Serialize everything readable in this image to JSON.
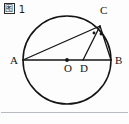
{
  "figure": {
    "caption_cjk": "图",
    "caption_number": "1",
    "caption_full": "图 1",
    "background_color": "#fdfdfd",
    "stroke_color": "#141414",
    "separator_color": "#b8bcc2"
  },
  "diagram": {
    "type": "circle-geometry",
    "circle": {
      "name": "main-circle",
      "center_x": 67,
      "center_y": 60,
      "radius": 44
    },
    "points": [
      {
        "id": "A",
        "label": "A",
        "x": 23,
        "y": 60,
        "label_x": 10,
        "label_y": 64,
        "dot": false
      },
      {
        "id": "B",
        "label": "B",
        "x": 111,
        "y": 60,
        "label_x": 115,
        "label_y": 64,
        "dot": false
      },
      {
        "id": "C",
        "label": "C",
        "x": 100,
        "y": 26,
        "label_x": 100,
        "label_y": 14,
        "dot": false
      },
      {
        "id": "O",
        "label": "O",
        "x": 67,
        "y": 60,
        "label_x": 64,
        "label_y": 72,
        "dot": true
      },
      {
        "id": "D",
        "label": "D",
        "x": 83,
        "y": 60,
        "label_x": 80,
        "label_y": 72,
        "dot": false
      }
    ],
    "segments": [
      {
        "name": "segment-AB",
        "from": "A",
        "to": "B"
      },
      {
        "name": "segment-AC",
        "from": "A",
        "to": "C"
      },
      {
        "name": "segment-CB",
        "from": "C",
        "to": "B"
      },
      {
        "name": "segment-CD",
        "from": "C",
        "to": "D"
      }
    ],
    "angle_markers": [
      {
        "name": "angle-marker-acd",
        "x": 94,
        "y": 33
      },
      {
        "name": "angle-marker-dcb",
        "x": 101,
        "y": 34
      }
    ]
  }
}
